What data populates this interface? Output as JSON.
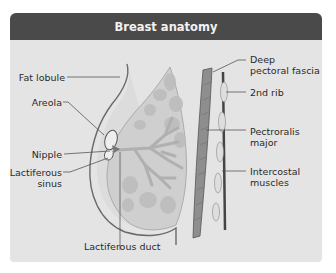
{
  "header": {
    "title": "Breast anatomy"
  },
  "colors": {
    "header_bg": "#4a4a4a",
    "header_text": "#f2f2f2",
    "body_bg": "#e4e4e4",
    "line": "#555555",
    "tissue": "#c8c8c8",
    "muscle": "#8a8a8a",
    "rib": "#d8d8d8",
    "intercostal": "#444444"
  },
  "labels": {
    "left": [
      {
        "id": "fat-lobule",
        "text": "Fat lobule"
      },
      {
        "id": "areola",
        "text": "Areola"
      },
      {
        "id": "nipple",
        "text": "Nipple"
      },
      {
        "id": "lactiferous-sinus",
        "line1": "Lactiferous",
        "line2": "sinus"
      }
    ],
    "bottom": [
      {
        "id": "lactiferous-duct",
        "text": "Lactiferous duct"
      }
    ],
    "right": [
      {
        "id": "deep-pectoral-fascia",
        "line1": "Deep",
        "line2": "pectoral fascia"
      },
      {
        "id": "2nd-rib",
        "text": "2nd rib"
      },
      {
        "id": "pectoralis-major",
        "line1": "Pectroralis",
        "line2": "major"
      },
      {
        "id": "intercostal-muscles",
        "line1": "Intercostal",
        "line2": "muscles"
      }
    ]
  }
}
